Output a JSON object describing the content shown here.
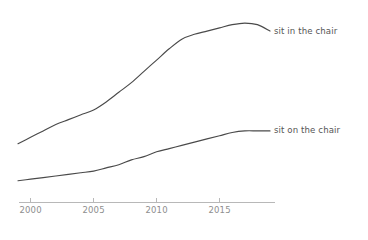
{
  "chart_data": {
    "type": "line",
    "title": "",
    "subtitle": "",
    "xlabel": "",
    "ylabel": "",
    "xlim": [
      1999,
      2019
    ],
    "ylim": [
      0,
      1.05
    ],
    "grid": false,
    "legend_position": "right-inline",
    "xticks": [
      "2000",
      "2005",
      "2010",
      "2015"
    ],
    "xtick_values": [
      2000,
      2005,
      2010,
      2015
    ],
    "yticks": [],
    "x": [
      1999,
      2000,
      2001,
      2002,
      2003,
      2004,
      2005,
      2006,
      2007,
      2008,
      2009,
      2010,
      2011,
      2012,
      2013,
      2014,
      2015,
      2016,
      2017,
      2018,
      2019
    ],
    "series": [
      {
        "name": "sit in the chair",
        "color": "#4a4a4a",
        "label_x": 2019,
        "values": [
          0.25,
          0.29,
          0.33,
          0.37,
          0.4,
          0.43,
          0.46,
          0.51,
          0.57,
          0.63,
          0.7,
          0.77,
          0.84,
          0.9,
          0.93,
          0.95,
          0.97,
          0.99,
          1.0,
          0.99,
          0.95
        ]
      },
      {
        "name": "sit on the chair",
        "color": "#4a4a4a",
        "label_x": 2019,
        "values": [
          0.02,
          0.03,
          0.04,
          0.05,
          0.06,
          0.07,
          0.08,
          0.1,
          0.12,
          0.15,
          0.17,
          0.2,
          0.22,
          0.24,
          0.26,
          0.28,
          0.3,
          0.32,
          0.33,
          0.33,
          0.33
        ]
      }
    ],
    "annotations": []
  },
  "axis": {
    "tick_color": "#b8b8b8",
    "tick_label_color": "#8e8e8e",
    "line_color": "#b8b8b8"
  },
  "theme": {
    "background": "#ffffff",
    "line_color": "#4a4a4a",
    "label_color": "#555555"
  }
}
